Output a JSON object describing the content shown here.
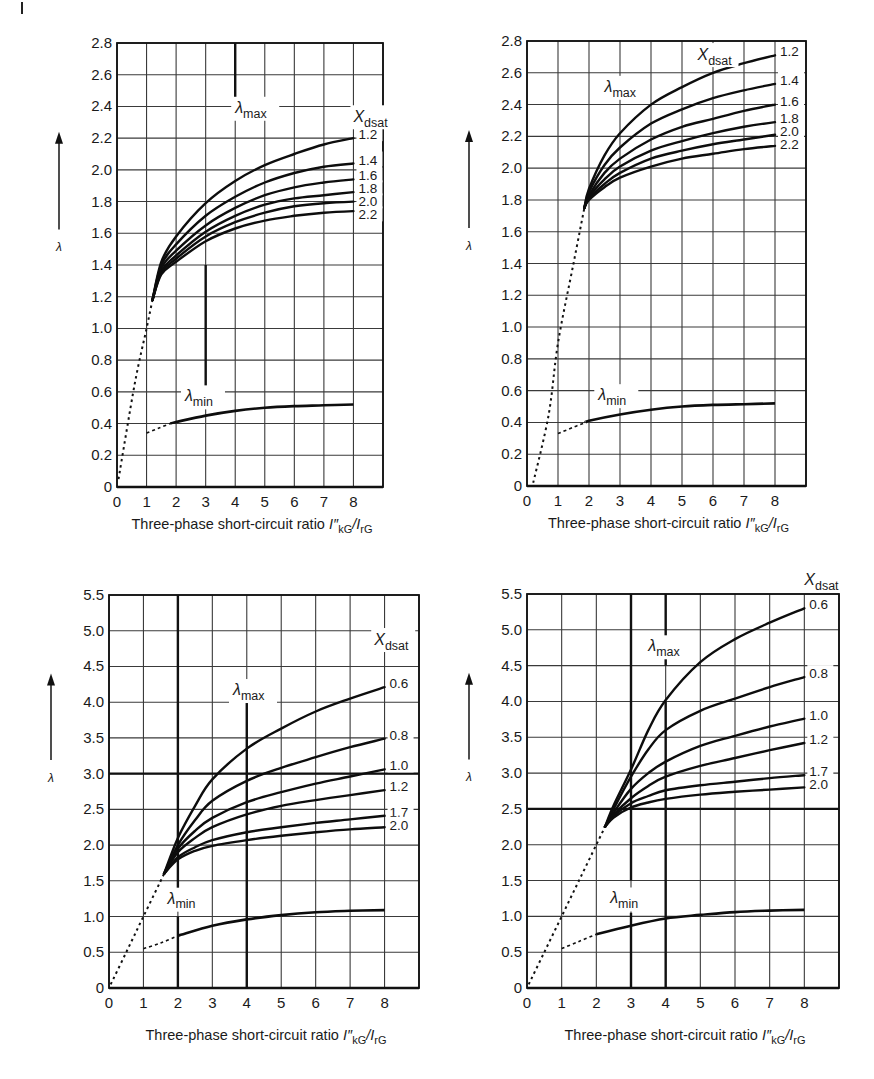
{
  "figure": {
    "panels": 4
  },
  "chart_data": [
    {
      "id": "top-left",
      "type": "line",
      "title": "",
      "xlabel": "Three-phase short-circuit ratio I\"kG/IrG",
      "ylabel": "λ",
      "xlim": [
        0,
        9
      ],
      "ylim": [
        0,
        2.8
      ],
      "xticks": [
        "0",
        "1",
        "2",
        "3",
        "4",
        "5",
        "6",
        "7",
        "8"
      ],
      "yticks": [
        "0",
        "0.2",
        "0.4",
        "0.6",
        "0.8",
        "1.0",
        "1.2",
        "1.4",
        "1.6",
        "1.8",
        "2.0",
        "2.2",
        "2.4",
        "2.6",
        "2.8"
      ],
      "ystep": 0.2,
      "grid": true,
      "legend_title": "Xdsat",
      "legend_position": "right-of-curve-ends",
      "annotations": [
        "λmax",
        "λmin"
      ],
      "lambda_max_label_pos": [
        4.0,
        2.36
      ],
      "lambda_min_label_pos": [
        2.3,
        0.54
      ],
      "xdsat_label_pos": [
        8.0,
        2.3
      ],
      "bold_vertical_segments": [
        {
          "x": 4,
          "y0": 2.4,
          "y1": 2.8
        },
        {
          "x": 3,
          "y0": 0.6,
          "y1": 1.4
        }
      ],
      "dashed_max": {
        "x": [
          0.05,
          0.6,
          1.0,
          1.2
        ],
        "y": [
          0.05,
          0.65,
          1.0,
          1.18
        ]
      },
      "dashed_min": {
        "x": [
          1.0,
          1.4,
          1.8
        ],
        "y": [
          0.34,
          0.37,
          0.4
        ]
      },
      "series": [
        {
          "name": "1.2",
          "x": [
            1.2,
            1.5,
            2,
            3,
            4,
            5,
            6,
            7,
            8
          ],
          "y": [
            1.18,
            1.42,
            1.58,
            1.79,
            1.93,
            2.03,
            2.1,
            2.16,
            2.2
          ]
        },
        {
          "name": "1.4",
          "x": [
            1.2,
            1.5,
            2,
            3,
            4,
            5,
            6,
            7,
            8
          ],
          "y": [
            1.18,
            1.4,
            1.53,
            1.71,
            1.83,
            1.92,
            1.98,
            2.02,
            2.04
          ]
        },
        {
          "name": "1.6",
          "x": [
            1.2,
            1.5,
            2,
            3,
            4,
            5,
            6,
            7,
            8
          ],
          "y": [
            1.18,
            1.38,
            1.49,
            1.65,
            1.76,
            1.84,
            1.89,
            1.92,
            1.94
          ]
        },
        {
          "name": "1.8",
          "x": [
            1.2,
            1.5,
            2,
            3,
            4,
            5,
            6,
            7,
            8
          ],
          "y": [
            1.18,
            1.36,
            1.46,
            1.61,
            1.71,
            1.78,
            1.82,
            1.84,
            1.86
          ]
        },
        {
          "name": "2.0",
          "x": [
            1.2,
            1.5,
            2,
            3,
            4,
            5,
            6,
            7,
            8
          ],
          "y": [
            1.18,
            1.35,
            1.44,
            1.58,
            1.67,
            1.73,
            1.77,
            1.79,
            1.8
          ]
        },
        {
          "name": "2.2",
          "x": [
            1.2,
            1.5,
            2,
            3,
            4,
            5,
            6,
            7,
            8
          ],
          "y": [
            1.18,
            1.34,
            1.42,
            1.55,
            1.63,
            1.68,
            1.71,
            1.73,
            1.74
          ]
        }
      ],
      "lambda_min": {
        "name": "λmin",
        "x": [
          1.8,
          2,
          3,
          4,
          5,
          6,
          7,
          8
        ],
        "y": [
          0.4,
          0.41,
          0.45,
          0.48,
          0.5,
          0.51,
          0.515,
          0.52
        ]
      }
    },
    {
      "id": "top-right",
      "type": "line",
      "title": "",
      "xlabel": "Three-phase short-circuit ratio I\"kG/IrG",
      "ylabel": "λ",
      "xlim": [
        0,
        9
      ],
      "ylim": [
        0,
        2.8
      ],
      "xticks": [
        "0",
        "1",
        "2",
        "3",
        "4",
        "5",
        "6",
        "7",
        "8"
      ],
      "yticks": [
        "0",
        "0.2",
        "0.4",
        "0.6",
        "0.8",
        "1.0",
        "1.2",
        "1.4",
        "1.6",
        "1.8",
        "2.0",
        "2.2",
        "2.4",
        "2.6",
        "2.8"
      ],
      "ystep": 0.2,
      "grid": true,
      "legend_title": "Xdsat",
      "legend_position": "right-of-curve-ends",
      "annotations": [
        "λmax",
        "λmin"
      ],
      "lambda_max_label_pos": [
        2.5,
        2.48
      ],
      "lambda_min_label_pos": [
        2.3,
        0.54
      ],
      "xdsat_label_pos": [
        5.5,
        2.68
      ],
      "bold_vertical_segments": [],
      "dashed_max": {
        "x": [
          0.2,
          0.7,
          1.0,
          1.5,
          1.85
        ],
        "y": [
          0.02,
          0.45,
          0.9,
          1.4,
          1.75
        ]
      },
      "dashed_min": {
        "x": [
          1.0,
          1.5,
          1.9
        ],
        "y": [
          0.33,
          0.37,
          0.4
        ]
      },
      "series": [
        {
          "name": "1.2",
          "x": [
            1.85,
            2,
            2.5,
            3,
            4,
            5,
            6,
            7,
            8
          ],
          "y": [
            1.75,
            1.87,
            2.08,
            2.22,
            2.4,
            2.51,
            2.6,
            2.66,
            2.71
          ]
        },
        {
          "name": "1.4",
          "x": [
            1.85,
            2,
            2.5,
            3,
            4,
            5,
            6,
            7,
            8
          ],
          "y": [
            1.75,
            1.85,
            2.02,
            2.13,
            2.28,
            2.37,
            2.44,
            2.49,
            2.53
          ]
        },
        {
          "name": "1.6",
          "x": [
            1.85,
            2,
            2.5,
            3,
            4,
            5,
            6,
            7,
            8
          ],
          "y": [
            1.75,
            1.83,
            1.97,
            2.06,
            2.18,
            2.26,
            2.31,
            2.36,
            2.4
          ]
        },
        {
          "name": "1.8",
          "x": [
            1.85,
            2,
            2.5,
            3,
            4,
            5,
            6,
            7,
            8
          ],
          "y": [
            1.75,
            1.82,
            1.93,
            2.01,
            2.11,
            2.17,
            2.22,
            2.26,
            2.29
          ]
        },
        {
          "name": "2.0",
          "x": [
            1.85,
            2,
            2.5,
            3,
            4,
            5,
            6,
            7,
            8
          ],
          "y": [
            1.75,
            1.81,
            1.9,
            1.97,
            2.06,
            2.11,
            2.15,
            2.18,
            2.21
          ]
        },
        {
          "name": "2.2",
          "x": [
            1.85,
            2,
            2.5,
            3,
            4,
            5,
            6,
            7,
            8
          ],
          "y": [
            1.75,
            1.8,
            1.88,
            1.94,
            2.01,
            2.06,
            2.09,
            2.12,
            2.14
          ]
        }
      ],
      "lambda_min": {
        "name": "λmin",
        "x": [
          1.9,
          2,
          3,
          4,
          5,
          6,
          7,
          8
        ],
        "y": [
          0.4,
          0.41,
          0.45,
          0.48,
          0.5,
          0.51,
          0.515,
          0.52
        ]
      }
    },
    {
      "id": "bottom-left",
      "type": "line",
      "title": "",
      "xlabel": "Three-phase short-circuit ratio I\"kG/IrG",
      "ylabel": "λ",
      "xlim": [
        0,
        9
      ],
      "ylim": [
        0,
        5.5
      ],
      "xticks": [
        "0",
        "1",
        "2",
        "3",
        "4",
        "5",
        "6",
        "7",
        "8"
      ],
      "yticks": [
        "0",
        "0.5",
        "1.0",
        "1.5",
        "2.0",
        "2.5",
        "3.0",
        "3.5",
        "4.0",
        "4.5",
        "5.0",
        "5.5"
      ],
      "ystep": 0.5,
      "grid": true,
      "legend_title": "Xdsat",
      "legend_position": "right-of-curve-ends",
      "annotations": [
        "λmax",
        "λmin"
      ],
      "lambda_max_label_pos": [
        3.6,
        4.1
      ],
      "lambda_min_label_pos": [
        1.7,
        1.18
      ],
      "xdsat_label_pos": [
        7.7,
        4.8
      ],
      "bold_vertical_segments": [
        {
          "x": 2,
          "y0": 1.4,
          "y1": 5.5
        },
        {
          "x": 2,
          "y0": 0,
          "y1": 1.0
        },
        {
          "x": 4,
          "y0": 0,
          "y1": 4.0
        }
      ],
      "bold_horizontal_segments": [
        {
          "y": 3.0,
          "x0": 0,
          "x1": 9
        }
      ],
      "dashed_max": {
        "x": [
          0.05,
          0.5,
          1.0,
          1.6
        ],
        "y": [
          0.05,
          0.5,
          1.0,
          1.6
        ]
      },
      "dashed_min": {
        "x": [
          1.0,
          1.5,
          2.0
        ],
        "y": [
          0.55,
          0.63,
          0.73
        ]
      },
      "series": [
        {
          "name": "0.6",
          "x": [
            1.6,
            2,
            2.5,
            3,
            4,
            5,
            6,
            7,
            8
          ],
          "y": [
            1.6,
            2.1,
            2.55,
            2.92,
            3.35,
            3.63,
            3.87,
            4.05,
            4.21
          ]
        },
        {
          "name": "0.8",
          "x": [
            1.6,
            2,
            2.5,
            3,
            4,
            5,
            6,
            7,
            8
          ],
          "y": [
            1.6,
            2.0,
            2.35,
            2.62,
            2.9,
            3.08,
            3.23,
            3.37,
            3.49
          ]
        },
        {
          "name": "1.0",
          "x": [
            1.6,
            2,
            2.5,
            3,
            4,
            5,
            6,
            7,
            8
          ],
          "y": [
            1.6,
            1.95,
            2.2,
            2.38,
            2.6,
            2.74,
            2.86,
            2.96,
            3.06
          ]
        },
        {
          "name": "1.2",
          "x": [
            1.6,
            2,
            2.5,
            3,
            4,
            5,
            6,
            7,
            8
          ],
          "y": [
            1.6,
            1.9,
            2.1,
            2.25,
            2.43,
            2.55,
            2.63,
            2.7,
            2.77
          ]
        },
        {
          "name": "1.7",
          "x": [
            1.6,
            2,
            2.5,
            3,
            4,
            5,
            6,
            7,
            8
          ],
          "y": [
            1.6,
            1.83,
            1.97,
            2.07,
            2.18,
            2.25,
            2.31,
            2.36,
            2.41
          ]
        },
        {
          "name": "2.0",
          "x": [
            1.6,
            2,
            2.5,
            3,
            4,
            5,
            6,
            7,
            8
          ],
          "y": [
            1.6,
            1.8,
            1.92,
            1.99,
            2.07,
            2.13,
            2.18,
            2.22,
            2.25
          ]
        }
      ],
      "lambda_min": {
        "name": "λmin",
        "x": [
          2,
          3,
          4,
          5,
          6,
          7,
          8
        ],
        "y": [
          0.73,
          0.87,
          0.96,
          1.02,
          1.06,
          1.08,
          1.09
        ]
      }
    },
    {
      "id": "bottom-right",
      "type": "line",
      "title": "",
      "xlabel": "Three-phase short-circuit ratio I\"kG/IrG",
      "ylabel": "λ",
      "xlim": [
        0,
        9
      ],
      "ylim": [
        0,
        5.5
      ],
      "xticks": [
        "0",
        "1",
        "2",
        "3",
        "4",
        "5",
        "6",
        "7",
        "8"
      ],
      "yticks": [
        "0",
        "0.5",
        "1.0",
        "1.5",
        "2.0",
        "2.5",
        "3.0",
        "3.5",
        "4.0",
        "4.5",
        "5.0",
        "5.5"
      ],
      "ystep": 0.5,
      "grid": true,
      "legend_title": "Xdsat",
      "legend_position": "above-top-right",
      "annotations": [
        "λmax",
        "λmin"
      ],
      "lambda_max_label_pos": [
        3.5,
        4.7
      ],
      "lambda_min_label_pos": [
        2.4,
        1.18
      ],
      "xdsat_label_pos": [
        8.0,
        5.62
      ],
      "bold_vertical_segments": [
        {
          "x": 3,
          "y0": 1.5,
          "y1": 5.5
        },
        {
          "x": 3,
          "y0": 0,
          "y1": 1.05
        },
        {
          "x": 4,
          "y0": 4.5,
          "y1": 5.5
        },
        {
          "x": 4,
          "y0": 0,
          "y1": 4.0
        }
      ],
      "bold_horizontal_segments": [
        {
          "y": 2.5,
          "x0": 0,
          "x1": 9
        }
      ],
      "dashed_max": {
        "x": [
          0.05,
          0.5,
          1.0,
          1.5,
          2.0,
          2.25
        ],
        "y": [
          0.05,
          0.5,
          1.0,
          1.5,
          2.0,
          2.25
        ]
      },
      "dashed_min": {
        "x": [
          1.0,
          1.5,
          2.0
        ],
        "y": [
          0.55,
          0.65,
          0.75
        ]
      },
      "series": [
        {
          "name": "0.6",
          "x": [
            2.25,
            2.5,
            3,
            3.5,
            4,
            5,
            6,
            7,
            8
          ],
          "y": [
            2.25,
            2.55,
            3.05,
            3.6,
            4.02,
            4.55,
            4.87,
            5.1,
            5.3
          ]
        },
        {
          "name": "0.8",
          "x": [
            2.25,
            2.5,
            3,
            3.5,
            4,
            5,
            6,
            7,
            8
          ],
          "y": [
            2.25,
            2.5,
            2.95,
            3.33,
            3.6,
            3.87,
            4.04,
            4.2,
            4.34
          ]
        },
        {
          "name": "1.0",
          "x": [
            2.25,
            2.5,
            3,
            3.5,
            4,
            5,
            6,
            7,
            8
          ],
          "y": [
            2.25,
            2.45,
            2.78,
            3.0,
            3.16,
            3.38,
            3.52,
            3.65,
            3.76
          ]
        },
        {
          "name": "1.2",
          "x": [
            2.25,
            2.5,
            3,
            3.5,
            4,
            5,
            6,
            7,
            8
          ],
          "y": [
            2.25,
            2.42,
            2.65,
            2.82,
            2.95,
            3.1,
            3.21,
            3.32,
            3.42
          ]
        },
        {
          "name": "1.7",
          "x": [
            2.25,
            2.5,
            3,
            3.5,
            4,
            5,
            6,
            7,
            8
          ],
          "y": [
            2.25,
            2.4,
            2.58,
            2.68,
            2.76,
            2.83,
            2.88,
            2.93,
            2.97
          ]
        },
        {
          "name": "2.0",
          "x": [
            2.25,
            2.5,
            3,
            3.5,
            4,
            5,
            6,
            7,
            8
          ],
          "y": [
            2.25,
            2.38,
            2.52,
            2.59,
            2.64,
            2.7,
            2.74,
            2.77,
            2.8
          ]
        }
      ],
      "lambda_min": {
        "name": "λmin",
        "x": [
          2,
          3,
          4,
          5,
          6,
          7,
          8
        ],
        "y": [
          0.75,
          0.87,
          0.97,
          1.02,
          1.06,
          1.08,
          1.09
        ]
      }
    }
  ],
  "layout": [
    {
      "left": 0,
      "top": 0,
      "plot": {
        "x0": 117,
        "x1": 383,
        "y0": 43,
        "y1": 487
      }
    },
    {
      "left": 0,
      "top": 0,
      "plot": {
        "x0": 527,
        "x1": 806,
        "y0": 41,
        "y1": 486
      }
    },
    {
      "left": 0,
      "top": 0,
      "plot": {
        "x0": 109,
        "x1": 419,
        "y0": 595,
        "y1": 988
      }
    },
    {
      "left": 0,
      "top": 0,
      "plot": {
        "x0": 527,
        "x1": 839,
        "y0": 594,
        "y1": 988
      }
    }
  ]
}
